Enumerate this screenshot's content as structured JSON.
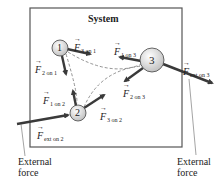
{
  "title": "System",
  "particles": [
    {
      "id": "1",
      "label": "1"
    },
    {
      "id": "2",
      "label": "2"
    },
    {
      "id": "3",
      "label": "3"
    }
  ],
  "forces": {
    "f3on1": {
      "symbol": "F",
      "sub": "3 on 1"
    },
    "f2on1": {
      "symbol": "F",
      "sub": "2 on 1"
    },
    "f1on3": {
      "symbol": "F",
      "sub": "1 on 3"
    },
    "f2on3": {
      "symbol": "F",
      "sub": "2 on 3"
    },
    "f1on2": {
      "symbol": "F",
      "sub": "1 on 2"
    },
    "f3on2": {
      "symbol": "F",
      "sub": "3 on 2"
    },
    "fexton2": {
      "symbol": "F",
      "sub": "ext on 2"
    },
    "fexton3": {
      "symbol": "F",
      "sub": "ext on 3"
    }
  },
  "external_left": {
    "line1": "External",
    "line2": "force"
  },
  "external_right": {
    "line1": "External",
    "line2": "force"
  },
  "colors": {
    "arrow": "#3a3a3a",
    "box": "#555555",
    "particle_fill": "#e6e6e6",
    "dashed": "#777777"
  }
}
